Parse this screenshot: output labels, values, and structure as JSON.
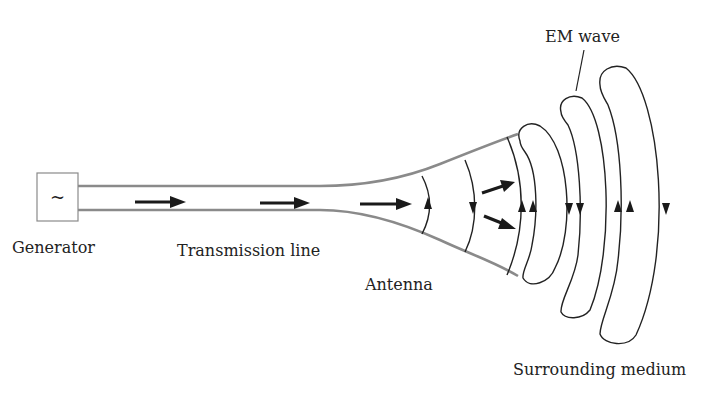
{
  "diagram": {
    "type": "antenna-radiation-schematic",
    "labels": {
      "generator": "Generator",
      "generator_symbol": "~",
      "transmission_line": "Transmission line",
      "antenna": "Antenna",
      "em_wave": "EM wave",
      "surrounding_medium": "Surrounding medium"
    },
    "components": [
      {
        "id": "generator",
        "label": "Generator"
      },
      {
        "id": "transmission-line",
        "label": "Transmission line"
      },
      {
        "id": "antenna",
        "label": "Antenna"
      },
      {
        "id": "em-wave",
        "label": "EM wave"
      },
      {
        "id": "surrounding-medium",
        "label": "Surrounding medium"
      }
    ],
    "flow": [
      "Generator",
      "Transmission line",
      "Antenna",
      "EM wave",
      "Surrounding medium"
    ],
    "colors": {
      "conductor": "#8a8a8a",
      "field_lines": "#222222",
      "arrows": "#1a1a1a",
      "background": "#ffffff"
    }
  }
}
